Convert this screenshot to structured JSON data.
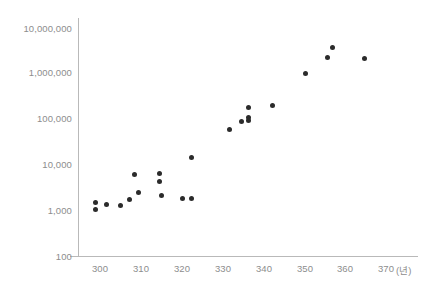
{
  "chart_data": {
    "type": "scatter",
    "title": "",
    "subtitle": "",
    "xlabel": "(년)",
    "ylabel": "",
    "xlim": [
      296,
      374
    ],
    "ylim": [
      100,
      10000000
    ],
    "yscale": "log",
    "xscale": "linear",
    "grid": false,
    "legend": null,
    "xticks": [
      300,
      310,
      320,
      330,
      340,
      350,
      360,
      370
    ],
    "xtick_labels": [
      "300",
      "310",
      "320",
      "330",
      "340",
      "350",
      "360",
      "370"
    ],
    "yticks": [
      100,
      1000,
      10000,
      100000,
      1000000,
      10000000
    ],
    "ytick_labels": [
      "100",
      "1,000",
      "10,000",
      "100,000",
      "1,000,000",
      "10,000,000"
    ],
    "marker": "circle",
    "marker_color": "#2b2b2b",
    "marker_size": 5,
    "points": [
      {
        "x": 298.8,
        "y": 1450
      },
      {
        "x": 298.8,
        "y": 1020
      },
      {
        "x": 301.7,
        "y": 1300
      },
      {
        "x": 304.9,
        "y": 1250
      },
      {
        "x": 308.5,
        "y": 6000
      },
      {
        "x": 309.5,
        "y": 2400
      },
      {
        "x": 307.3,
        "y": 1700
      },
      {
        "x": 314.6,
        "y": 6300
      },
      {
        "x": 314.6,
        "y": 4200
      },
      {
        "x": 315.1,
        "y": 2050
      },
      {
        "x": 320.2,
        "y": 1800
      },
      {
        "x": 322.4,
        "y": 14000
      },
      {
        "x": 322.2,
        "y": 1750
      },
      {
        "x": 331.5,
        "y": 55000
      },
      {
        "x": 334.4,
        "y": 85000
      },
      {
        "x": 336.1,
        "y": 170000
      },
      {
        "x": 336.1,
        "y": 105000
      },
      {
        "x": 336.1,
        "y": 88000
      },
      {
        "x": 342.0,
        "y": 190000
      },
      {
        "x": 350.0,
        "y": 950000
      },
      {
        "x": 355.4,
        "y": 2100000
      },
      {
        "x": 356.8,
        "y": 3400000
      },
      {
        "x": 364.4,
        "y": 2000000
      }
    ]
  },
  "axis": {
    "y_labels": [
      "10,000,000",
      "1,000,000",
      "100,000",
      "10,000",
      "1,000",
      "100"
    ],
    "x_labels": [
      "300",
      "310",
      "320",
      "330",
      "340",
      "350",
      "360",
      "370"
    ],
    "x_unit": "(년)"
  },
  "style": {
    "axis_color": "#b9b9b9",
    "tick_text_color": "#8d8d8d",
    "point_color": "#2b2b2b",
    "background": "#ffffff"
  }
}
